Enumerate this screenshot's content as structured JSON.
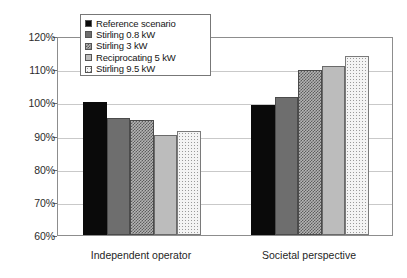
{
  "chart_data": {
    "type": "bar",
    "title": "",
    "subtitle": "",
    "xlabel": "",
    "ylabel": "",
    "categories": [
      "Independent operator",
      "Societal perspective"
    ],
    "ylim": [
      60,
      120
    ],
    "ytick_labels": [
      "120%",
      "110%",
      "100%",
      "90%",
      "80%",
      "70%",
      "60%"
    ],
    "ytick_values": [
      120,
      110,
      100,
      90,
      80,
      70,
      60
    ],
    "grid": true,
    "legend_position": "top-left-inside",
    "value_suffix": "%",
    "series": [
      {
        "name": "Reference scenario",
        "fill": "solid-black",
        "color": "#0a0a0a",
        "values": [
          100.0,
          99.3
        ]
      },
      {
        "name": "Stirling 0.8 kW",
        "fill": "dark-gray",
        "color": "#6e6e6e",
        "values": [
          95.2,
          101.5
        ]
      },
      {
        "name": "Stirling 3 kW",
        "fill": "crosshatch",
        "color": "#8d8d8d",
        "values": [
          94.6,
          109.8
        ]
      },
      {
        "name": "Reciprocating 5 kW",
        "fill": "light-gray",
        "color": "#bcbcbc",
        "values": [
          90.2,
          111.1
        ]
      },
      {
        "name": "Stirling 9.5 kW",
        "fill": "dotted",
        "color": "#f4f4f4",
        "values": [
          91.5,
          114.0
        ]
      }
    ]
  }
}
